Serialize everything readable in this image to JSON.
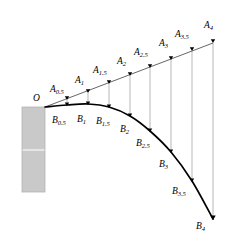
{
  "figure": {
    "width": 229,
    "height": 242,
    "background": "#ffffff"
  },
  "colors": {
    "curve": "#000000",
    "straight_line": "#555555",
    "drop_line": "#9a9a9a",
    "wall_fill": "#c9c9c9",
    "wall_stroke": "#b5b5b5",
    "wall_divider": "#ededed",
    "label": "#000000"
  },
  "wall": {
    "x": 22,
    "y": 107,
    "width": 23,
    "height": 85,
    "divider_y": 150
  },
  "origin": {
    "label": "O",
    "x": 45,
    "y": 107
  },
  "chart_data": {
    "type": "scatter",
    "title": "",
    "xlabel": "",
    "ylabel": "",
    "grid": false,
    "legend": null,
    "xlim": [
      0,
      229
    ],
    "ylim": [
      242,
      0
    ],
    "annotations": [
      "O"
    ],
    "series": [
      {
        "name": "A",
        "role": "straight-line trajectory (no gravity)",
        "marker": "down-arrowhead",
        "points": [
          {
            "label": "A",
            "sub": "0.5",
            "x": 67,
            "y": 100,
            "label_x": 50,
            "label_y": 85
          },
          {
            "label": "A",
            "sub": "1",
            "x": 88,
            "y": 93,
            "label_x": 75,
            "label_y": 76
          },
          {
            "label": "A",
            "sub": "1.5",
            "x": 109,
            "y": 84,
            "label_x": 93,
            "label_y": 66
          },
          {
            "label": "A",
            "sub": "2",
            "x": 130,
            "y": 76,
            "label_x": 117,
            "label_y": 57
          },
          {
            "label": "A",
            "sub": "2.5",
            "x": 150,
            "y": 68,
            "label_x": 134,
            "label_y": 48
          },
          {
            "label": "A",
            "sub": "3",
            "x": 171,
            "y": 60,
            "label_x": 159,
            "label_y": 39
          },
          {
            "label": "A",
            "sub": "3.5",
            "x": 192,
            "y": 51,
            "label_x": 175,
            "label_y": 30
          },
          {
            "label": "A",
            "sub": "4",
            "x": 213,
            "y": 43,
            "label_x": 204,
            "label_y": 21
          }
        ]
      },
      {
        "name": "B",
        "role": "actual curved trajectory (with gravity)",
        "marker": "down-arrowhead",
        "points": [
          {
            "label": "B",
            "sub": "0.5",
            "x": 67,
            "y": 105,
            "label_x": 52,
            "label_y": 116
          },
          {
            "label": "B",
            "sub": "1",
            "x": 88,
            "y": 104,
            "label_x": 77,
            "label_y": 115
          },
          {
            "label": "B",
            "sub": "1.5",
            "x": 109,
            "y": 107,
            "label_x": 96,
            "label_y": 117
          },
          {
            "label": "B",
            "sub": "2",
            "x": 130,
            "y": 116,
            "label_x": 120,
            "label_y": 125
          },
          {
            "label": "B",
            "sub": "2.5",
            "x": 150,
            "y": 131,
            "label_x": 136,
            "label_y": 139
          },
          {
            "label": "B",
            "sub": "3",
            "x": 171,
            "y": 152,
            "label_x": 159,
            "label_y": 160
          },
          {
            "label": "B",
            "sub": "3.5",
            "x": 192,
            "y": 181,
            "label_x": 172,
            "label_y": 187
          },
          {
            "label": "B",
            "sub": "4",
            "x": 213,
            "y": 219,
            "label_x": 196,
            "label_y": 222
          }
        ]
      }
    ],
    "connectors": {
      "description": "vertical gravity-drop segments from each A point to the matching B point",
      "pairs": [
        {
          "from": "A0.5",
          "to": "B0.5"
        },
        {
          "from": "A1",
          "to": "B1"
        },
        {
          "from": "A1.5",
          "to": "B1.5"
        },
        {
          "from": "A2",
          "to": "B2"
        },
        {
          "from": "A2.5",
          "to": "B2.5"
        },
        {
          "from": "A3",
          "to": "B3"
        },
        {
          "from": "A3.5",
          "to": "B3.5"
        },
        {
          "from": "A4",
          "to": "B4"
        }
      ]
    }
  }
}
